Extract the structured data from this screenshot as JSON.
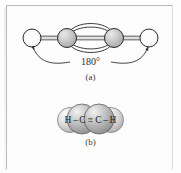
{
  "figure": {
    "panel_a": {
      "caption": "(a)",
      "angle_label": "180°",
      "model_type": "ball-and-stick-with-pi-orbitals",
      "atoms": [
        {
          "element": "H",
          "role": "hydrogen-left",
          "fill": "#ffffff",
          "cx": 32,
          "cy": 38,
          "r": 9
        },
        {
          "element": "C",
          "role": "carbon-left",
          "fill": "#c9c9c9",
          "cx": 67,
          "cy": 38,
          "r": 9.5
        },
        {
          "element": "C",
          "role": "carbon-right",
          "fill": "#c9c9c9",
          "cx": 114,
          "cy": 38,
          "r": 9.5
        },
        {
          "element": "H",
          "role": "hydrogen-right",
          "fill": "#ffffff",
          "cx": 149,
          "cy": 38,
          "r": 9
        }
      ],
      "bonds": [
        {
          "type": "sigma",
          "from": "hydrogen-left",
          "to": "carbon-left"
        },
        {
          "type": "triple",
          "from": "carbon-left",
          "to": "carbon-right"
        },
        {
          "type": "sigma",
          "from": "carbon-right",
          "to": "hydrogen-right"
        }
      ]
    },
    "panel_b": {
      "caption": "(b)",
      "model_type": "space-filling",
      "formula": "H",
      "formula_parts": {
        "h_left": "H",
        "dash_left": "–",
        "c_left": "C",
        "triple_bond": "≡",
        "c_right": "C",
        "dash_right": "–",
        "h_right": "H"
      }
    }
  },
  "colors": {
    "ink": "#2b2b2b",
    "carbon_fill": "#c9c9c9",
    "hydrogen_fill": "#ffffff",
    "frame": "#b9b9b9",
    "page": "#fdfdfd"
  }
}
